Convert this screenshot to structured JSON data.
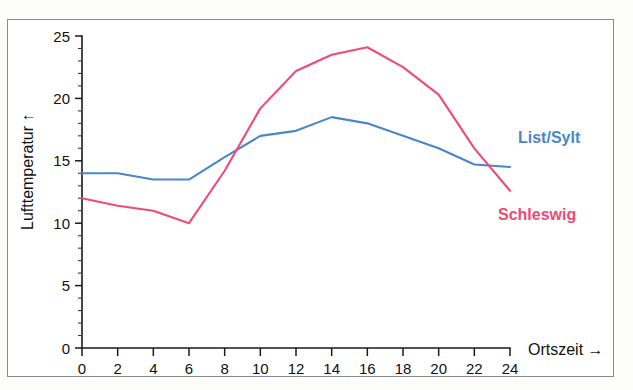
{
  "chart_data": {
    "type": "line",
    "title": "",
    "xlabel": "Ortszeit →",
    "ylabel": "Lufttemperatur ↑",
    "xlim": [
      0,
      24
    ],
    "ylim": [
      0,
      25
    ],
    "grid": false,
    "x": [
      0,
      2,
      4,
      6,
      8,
      10,
      12,
      14,
      16,
      18,
      20,
      22,
      24
    ],
    "xticks": [
      "0",
      "2",
      "4",
      "6",
      "8",
      "10",
      "12",
      "14",
      "16",
      "18",
      "20",
      "22",
      "24"
    ],
    "yticks": [
      "0",
      "5",
      "10",
      "15",
      "20",
      "25"
    ],
    "y_minor_step": 1,
    "x_minor_step": 2,
    "legend_position": "inline-right",
    "series": [
      {
        "name": "List/Sylt",
        "color": "#4a86c8",
        "values": [
          14.0,
          14.0,
          13.5,
          13.5,
          15.3,
          17.0,
          17.4,
          18.5,
          18.0,
          17.0,
          16.0,
          14.7,
          14.5
        ]
      },
      {
        "name": "Schleswig",
        "color": "#ef4a78",
        "values": [
          12.0,
          11.4,
          11.0,
          10.0,
          14.2,
          19.2,
          22.2,
          23.5,
          24.1,
          22.5,
          20.3,
          16.0,
          12.6
        ]
      }
    ],
    "annotations": [
      {
        "text": "List/Sylt",
        "color": "#4a86c8",
        "x_px": 518,
        "y_px": 143
      },
      {
        "text": "Schleswig",
        "color": "#ef4a78",
        "x_px": 498,
        "y_px": 220
      }
    ]
  }
}
